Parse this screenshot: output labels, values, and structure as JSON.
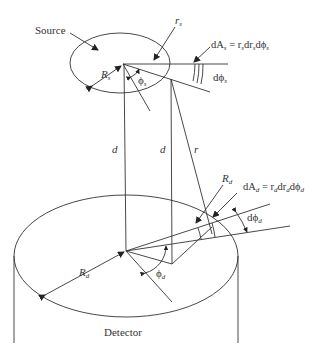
{
  "diagram": {
    "labels": {
      "source": "Source",
      "detector": "Detector",
      "rs": "r",
      "rs_sub": "s",
      "Rs": "R",
      "Rs_sub": "s",
      "phis": "ϕ",
      "phis_sub": "s",
      "dphis": "dϕ",
      "dphis_sub": "s",
      "dAs": "dA",
      "dAs_sub": "s",
      "dAs_eq": " = r",
      "dAs_eq_s1": "s",
      "dAs_eq_mid": "dr",
      "dAs_eq_s2": "s",
      "dAs_eq_end": "dϕ",
      "dAs_eq_s3": "s",
      "d1": "d",
      "d2": "d",
      "r": "r",
      "Rd": "R",
      "Rd_sub": "d",
      "dAd": "dA",
      "dAd_sub": "d",
      "dAd_eq": " = r",
      "dAd_eq_s1": "d",
      "dAd_eq_mid": "dr",
      "dAd_eq_s2": "d",
      "dAd_eq_end": "dϕ",
      "dAd_eq_s3": "d",
      "dphid": "dϕ",
      "dphid_sub": "d",
      "phid": "ϕ",
      "phid_sub": "d",
      "Rd2": "R",
      "Rd2_sub": "d"
    },
    "colors": {
      "line": "#333333",
      "background": "#ffffff"
    }
  }
}
